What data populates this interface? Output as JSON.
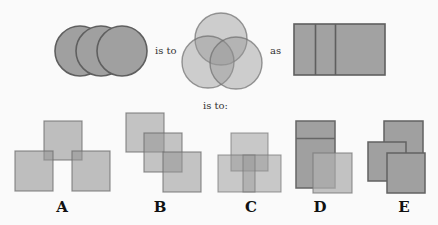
{
  "question": {
    "connector_1": "is to",
    "connector_2": "as",
    "connector_3": "is to:"
  },
  "colors": {
    "fill_dark": "#9e9e9e",
    "fill_light": "#b3b3b3",
    "stroke_dark": "#5f5f5f",
    "stroke_light": "#8a8a8a",
    "background": "#fafafa"
  },
  "options": [
    {
      "letter": "A"
    },
    {
      "letter": "B"
    },
    {
      "letter": "C"
    },
    {
      "letter": "D"
    },
    {
      "letter": "E"
    }
  ]
}
